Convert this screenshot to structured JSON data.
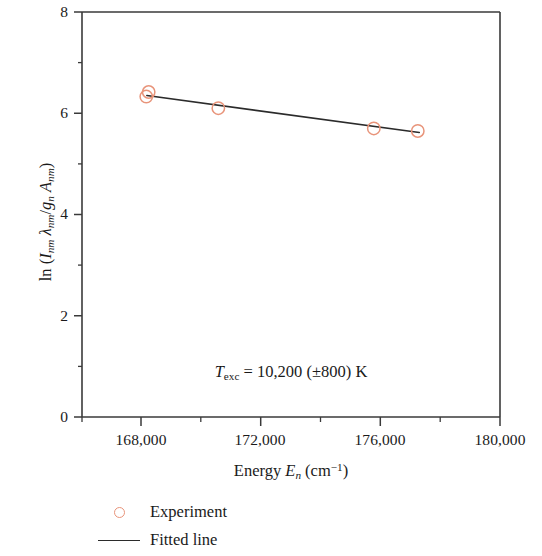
{
  "chart_data": {
    "type": "scatter",
    "title": "",
    "xlabel": "Energy E_n (cm^-1)",
    "ylabel": "ln (I_nm lambda_nm / g_n A_nm)",
    "xlim": [
      166020,
      180000
    ],
    "ylim": [
      0,
      8
    ],
    "grid": false,
    "legend_position": "below-axes-left",
    "x_ticks": [
      168000,
      172000,
      176000,
      180000
    ],
    "x_tick_labels": [
      "168,000",
      "172,000",
      "176,000",
      "180,000"
    ],
    "x_minor_ticks": [
      170000,
      174000,
      178000
    ],
    "y_ticks": [
      0,
      2,
      4,
      6,
      8
    ],
    "y_tick_labels": [
      "0",
      "2",
      "4",
      "6",
      "8"
    ],
    "y_minor_ticks": [
      1,
      3,
      5,
      7
    ],
    "series": [
      {
        "name": "Experiment",
        "type": "scatter",
        "marker": "open-circle",
        "color": "#E8947A",
        "points": [
          {
            "x": 168170,
            "y": 6.33
          },
          {
            "x": 168250,
            "y": 6.42
          },
          {
            "x": 170580,
            "y": 6.1
          },
          {
            "x": 175780,
            "y": 5.7
          },
          {
            "x": 177250,
            "y": 5.65
          }
        ]
      },
      {
        "name": "Fitted line",
        "type": "line",
        "color": "#2b2b2b",
        "points": [
          {
            "x": 168190,
            "y": 6.35
          },
          {
            "x": 177300,
            "y": 5.62
          }
        ]
      }
    ],
    "annotations": [
      {
        "name": "excitation-temperature",
        "text": "T_exc = 10,200 (±800) K",
        "x": 173000,
        "y": 1.05
      }
    ]
  },
  "axes": {
    "y_tick_labels": [
      "8",
      "6",
      "4",
      "2",
      "0"
    ],
    "x_tick_labels": [
      "168,000",
      "172,000",
      "176,000",
      "180,000"
    ],
    "y_title": {
      "prefix": "ln (",
      "i_sym": "I",
      "i_sub": "nm",
      "lambda_sym": "λ",
      "lambda_sub": "nm",
      "slash": "/",
      "g_sym": "g",
      "g_sub": "n",
      "a_sym": "A",
      "a_sub": "nm",
      "suffix": ")"
    },
    "x_title": {
      "word": "Energy",
      "e_sym": "E",
      "e_sub": "n",
      "unit_open": "(cm",
      "unit_sup": "−1",
      "unit_close": ")"
    }
  },
  "annotation": {
    "t_sym": "T",
    "t_sub": "exc",
    "rest": "= 10,200 (±800) K"
  },
  "legend": {
    "items": [
      {
        "label": "Experiment",
        "key": "open-circle",
        "color": "#E8947A"
      },
      {
        "label": "Fitted line",
        "key": "line",
        "color": "#2b2b2b"
      }
    ]
  },
  "colors": {
    "marker": "#E8947A",
    "line": "#2b2b2b",
    "axis": "#3a3a3a",
    "text": "#1a1a1a",
    "background": "#ffffff"
  }
}
